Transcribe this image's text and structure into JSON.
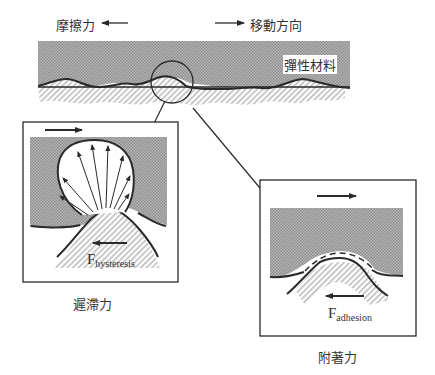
{
  "labels": {
    "friction_force": "摩擦力",
    "direction_of_motion": "移動方向",
    "elastic_material": "彈性材料",
    "hysteresis_caption": "遲滯力",
    "adhesion_caption": "附著力"
  },
  "force_labels": {
    "hysteresis": {
      "main": "F",
      "sub": "hysteresis"
    },
    "adhesion": {
      "main": "F",
      "sub": "adhesion"
    }
  },
  "colors": {
    "ink": "#2a2a2a",
    "hatch_dark": "#9a9a9a",
    "hatch_light": "#c8c8c8",
    "background": "#ffffff"
  }
}
